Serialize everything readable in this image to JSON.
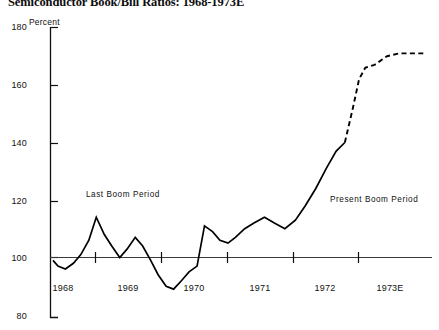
{
  "chart_data": {
    "type": "line",
    "title": "Semiconductor Book/Bill Ratios: 1968-1973E",
    "xlabel": "",
    "ylabel": "Percent",
    "ylim": [
      80,
      180
    ],
    "yticks": [
      80,
      100,
      120,
      140,
      160,
      180
    ],
    "xtick_labels": [
      "1968",
      "1969",
      "1970",
      "1971",
      "1972",
      "1973E"
    ],
    "grid": false,
    "legend": "none",
    "reference_line": 100,
    "annotations": [
      {
        "text": "Last Boom Period",
        "x": 1968.55,
        "y": 120
      },
      {
        "text": "Present Boom Period",
        "x": 1972.45,
        "y": 118
      }
    ],
    "series": [
      {
        "name": "Book/Bill Ratio (actual)",
        "style": "solid",
        "x": [
          1968.0,
          1968.08,
          1968.2,
          1968.33,
          1968.45,
          1968.58,
          1968.7,
          1968.83,
          1968.95,
          1969.08,
          1969.2,
          1969.33,
          1969.45,
          1969.58,
          1969.7,
          1969.83,
          1969.95,
          1970.08,
          1970.2,
          1970.33,
          1970.45,
          1970.58,
          1970.7,
          1970.83,
          1970.95,
          1971.1,
          1971.25,
          1971.42,
          1971.58,
          1971.75,
          1971.92,
          1972.08,
          1972.25,
          1972.42,
          1972.58,
          1972.72
        ],
        "values": [
          99,
          97,
          96,
          98,
          101,
          106,
          114,
          108,
          104,
          100,
          103,
          107,
          104,
          99,
          94,
          90,
          89,
          92,
          95,
          97,
          111,
          109,
          106,
          105,
          107,
          110,
          112,
          114,
          112,
          110,
          113,
          118,
          124,
          131,
          137,
          140
        ]
      },
      {
        "name": "Book/Bill Ratio (estimated)",
        "style": "dashed",
        "x": [
          1972.72,
          1972.85,
          1972.95,
          1973.05,
          1973.2,
          1973.4,
          1973.6,
          1973.85,
          1974.0
        ],
        "values": [
          140,
          152,
          162,
          166,
          167,
          170,
          171,
          171,
          171
        ]
      }
    ]
  },
  "axis": {
    "unit_label": "Percent"
  }
}
